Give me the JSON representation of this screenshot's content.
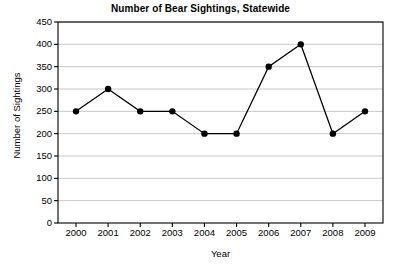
{
  "chart_data": {
    "type": "line",
    "title": "Number of Bear Sightings, Statewide",
    "xlabel": "Year",
    "ylabel": "Number of Sightings",
    "categories": [
      "2000",
      "2001",
      "2002",
      "2003",
      "2004",
      "2005",
      "2006",
      "2007",
      "2008",
      "2009"
    ],
    "values": [
      250,
      300,
      250,
      250,
      200,
      200,
      350,
      400,
      200,
      250
    ],
    "series": [
      {
        "name": "Bear Sightings",
        "values": [
          250,
          300,
          250,
          250,
          200,
          200,
          350,
          400,
          200,
          250
        ]
      }
    ],
    "ylim": [
      0,
      450
    ],
    "ytick_labels": [
      "0",
      "50",
      "100",
      "150",
      "200",
      "250",
      "300",
      "350",
      "400",
      "450"
    ],
    "ytick_values": [
      0,
      50,
      100,
      150,
      200,
      250,
      300,
      350,
      400,
      450
    ],
    "xtick_labels": [
      "2000",
      "2001",
      "2002",
      "2003",
      "2004",
      "2005",
      "2006",
      "2007",
      "2008",
      "2009"
    ],
    "grid": "horizontal",
    "legend": "none",
    "marker": "filled-circle",
    "colors": {
      "line": "#000000",
      "marker": "#000000",
      "grid": "#c8c8c8",
      "axis": "#000000",
      "background": "#ffffff"
    }
  }
}
